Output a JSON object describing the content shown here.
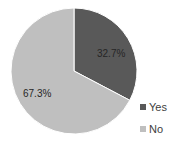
{
  "chart_data": {
    "type": "pie",
    "title": "",
    "categories": [
      "Yes",
      "No"
    ],
    "values": [
      32.7,
      67.3
    ],
    "labels": [
      "32.7%",
      "67.3%"
    ],
    "colors": [
      "#595959",
      "#bfbfbf"
    ],
    "start_angle": "12 o'clock, clockwise",
    "legend_position": "right-bottom"
  }
}
